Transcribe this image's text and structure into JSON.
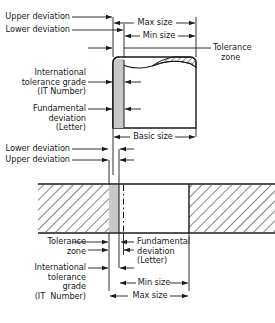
{
  "diagram": {
    "colors": {
      "line": "#1a1a1a",
      "tolerance_zone_fill": "#c8c8c8",
      "hatch": "#1a1a1a",
      "background": "#ffffff",
      "text": "#1a1a1a"
    },
    "shaft": {
      "labels": {
        "upper_deviation": "Upper deviation",
        "lower_deviation": "Lower deviation",
        "it_grade_line1": "International",
        "it_grade_line2": "tolerance grade",
        "it_grade_line3": "(IT Number)",
        "fundamental_deviation_line1": "Fundamental",
        "fundamental_deviation_line2": "deviation",
        "fundamental_deviation_line3": "(Letter)",
        "max_size": "Max size",
        "min_size": "Min size",
        "tolerance_zone_line1": "Tolerance",
        "tolerance_zone_line2": "zone",
        "basic_size": "Basic size"
      }
    },
    "hole": {
      "labels": {
        "lower_deviation": "Lower deviation",
        "upper_deviation": "Upper deviation",
        "tolerance_zone_line1": "Tolerance",
        "tolerance_zone_line2": "zone",
        "fundamental_deviation_line1": "Fundamental",
        "fundamental_deviation_line2": "deviation",
        "fundamental_deviation_line3": "(Letter)",
        "it_grade_line1": "International",
        "it_grade_line2": "tolerance",
        "it_grade_line3": "grade",
        "it_grade_line4": "(IT  Number)",
        "min_size": "Min size",
        "max_size": "Max size"
      }
    }
  }
}
